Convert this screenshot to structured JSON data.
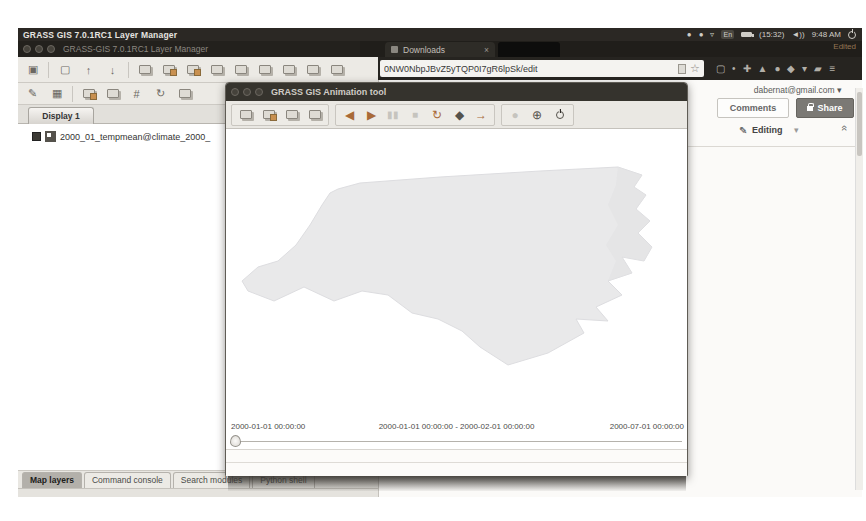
{
  "desktop_panel": {
    "focused_app_title": "GRASS GIS 7.0.1RC1 Layer Manager",
    "keyboard_indicator": "En",
    "battery_time": "(15:32)",
    "clock": "9:48 AM"
  },
  "browser": {
    "downloads_tab_label": "Downloads",
    "close_tab_glyph": "×",
    "url_value": "0NW0NbpJBvZ5yTQP0I7gR6lpSk/edit",
    "edited_indicator": "Edited"
  },
  "google_docs": {
    "account_email": "dabernat@gmail.com",
    "comments_button": "Comments",
    "share_button": "Share",
    "mode_label": "Editing"
  },
  "layer_manager": {
    "window_title": "GRASS-GIS 7.0.1RC1 Layer Manager",
    "display_tab_label": "Display 1",
    "layer_item": "2000_01_tempmean@climate_2000_",
    "bottom_tabs": [
      "Map layers",
      "Command console",
      "Search modules",
      "Python shell"
    ]
  },
  "animation_tool": {
    "window_title": "GRASS GIS Animation tool",
    "timeline_start": "2000-01-01 00:00:00",
    "timeline_current": "2000-01-01 00:00:00 - 2000-02-01 00:00:00",
    "timeline_end": "2000-07-01 00:00:00"
  },
  "icons": {
    "play_backward": "◀",
    "play_forward": "▶",
    "pause": "▮▮",
    "stop": "■",
    "loop": "↻",
    "bounce": "◆",
    "step_forward": "→",
    "globe": "●",
    "navigate": "⊕",
    "pencil": "✎",
    "attribute_table": "▦",
    "new_display": "▣",
    "new_workspace": "▢",
    "open_workspace": "↑",
    "save_workspace": "↓",
    "grid": "#",
    "toolbox": "↻",
    "bookmark_star": "☆",
    "menu": "≡",
    "caret_down": "▾",
    "wifi": "▿",
    "volume": "◄))",
    "tray_dot_1": "●",
    "tray_dot_2": "●",
    "ext_1": "✚",
    "ext_2": "▲",
    "ext_3": "●",
    "ext_4": "◆",
    "ext_5": "▾",
    "ext_6": "▰",
    "reader": "▢",
    "status_dot": "•"
  },
  "colors": {
    "panel_bg": "#2b2824",
    "accent_orange": "#a96a38",
    "share_button_bg": "#7b7975"
  }
}
